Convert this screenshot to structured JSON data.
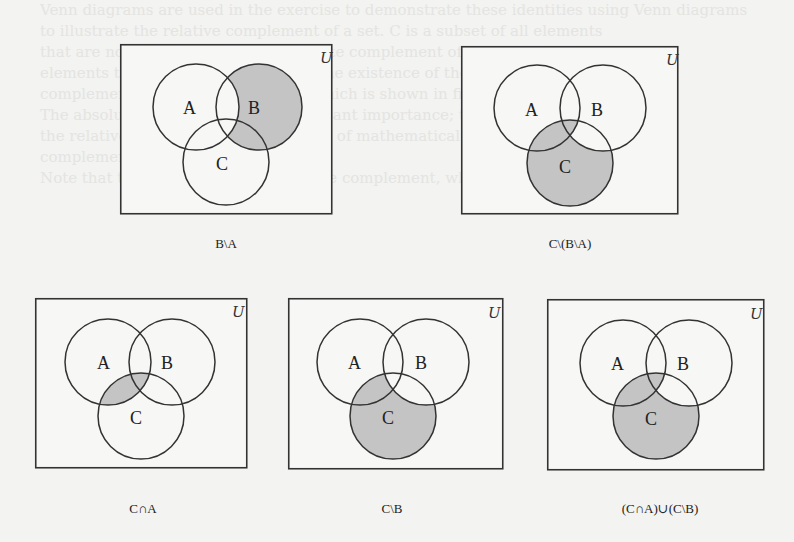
{
  "figure": {
    "universe_label": "U",
    "set_labels": {
      "a": "A",
      "b": "B",
      "c": "C"
    },
    "shade_color": "#c4c4c4",
    "line_color": "#333333",
    "diagrams": [
      {
        "id": "b-minus-a",
        "caption": "B\\A",
        "shaded_regions": [
          "B only",
          "B∩C only"
        ]
      },
      {
        "id": "c-minus-b-minus-a",
        "caption": "C\\(B\\A)",
        "shaded_regions": [
          "C only",
          "A∩C only",
          "A∩B∩C"
        ]
      },
      {
        "id": "c-intersect-a",
        "caption": "C∩A",
        "shaded_regions": [
          "A∩C only",
          "A∩B∩C"
        ]
      },
      {
        "id": "c-minus-b",
        "caption": "C\\B",
        "shaded_regions": [
          "C only",
          "A∩C only"
        ]
      },
      {
        "id": "c-intersect-a-union-c-minus-b",
        "caption": "(C∩A)∪(C\\B)",
        "shaded_regions": [
          "C only",
          "A∩C only",
          "A∩B∩C"
        ]
      }
    ]
  },
  "background_text": [
    "Venn diagrams are used in the exercise to demonstrate these identities using Venn diagrams",
    "to illustrate the relative complement of a set. C is a subset of all elements",
    "that are not in B. Here B is the absolute complement of A ... the set of all",
    "elements that are in U but not in A. The existence of the universe U. The",
    "complement A' is also written A^c, which is shown in figure U.",
    "The absolute complement is of significant importance; the notation for",
    "the relative complement ... in the case of mathematical logic, for the absolute",
    "complement of A; Figure 3.1 ...",
    "Note that the definition of the absolute complement, which ..."
  ]
}
